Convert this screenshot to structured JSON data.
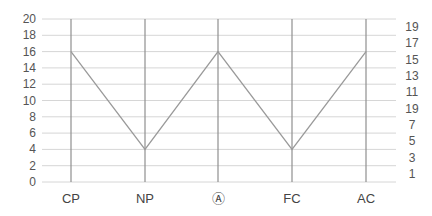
{
  "chart_data": {
    "type": "line",
    "title": "",
    "xlabel": "",
    "ylabel": "",
    "categories": [
      "CP",
      "NP",
      "Ⓐ",
      "FC",
      "AC"
    ],
    "series": [
      {
        "name": "series-1",
        "values": [
          16,
          4,
          16,
          4,
          16
        ]
      }
    ],
    "ylim": [
      0,
      20
    ],
    "left_axis_ticks": [
      "0",
      "2",
      "4",
      "6",
      "8",
      "10",
      "12",
      "14",
      "16",
      "18",
      "20"
    ],
    "right_axis_ticks": [
      "1",
      "3",
      "5",
      "7",
      "19",
      "11",
      "13",
      "15",
      "17",
      "19"
    ],
    "grid": true,
    "legend": "none"
  },
  "colors": {
    "line": "#9a9a9a",
    "grid": "#d6d6d6",
    "axis": "#8f8f8f"
  }
}
